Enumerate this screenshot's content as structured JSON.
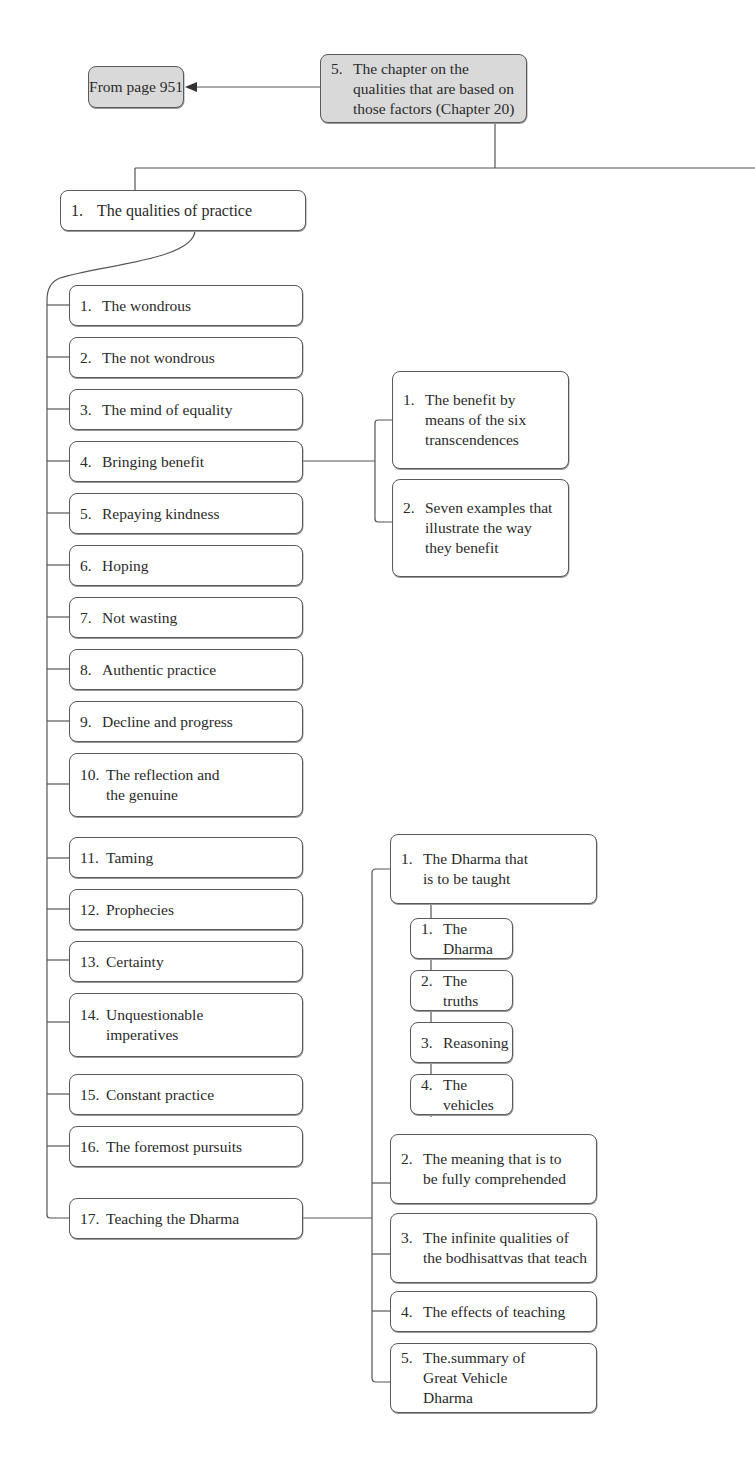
{
  "diagram": {
    "type": "outline-tree",
    "continuation": {
      "label": "From page 951"
    },
    "root": {
      "num": "5.",
      "label": "The chapter on the qualities that are based on those factors (Chapter 20)"
    },
    "level1": {
      "num": "1.",
      "label": "The qualities of practice"
    },
    "items": [
      {
        "num": "1.",
        "label": "The wondrous"
      },
      {
        "num": "2.",
        "label": "The not wondrous"
      },
      {
        "num": "3.",
        "label": "The mind of equality"
      },
      {
        "num": "4.",
        "label": "Bringing benefit"
      },
      {
        "num": "5.",
        "label": "Repaying kindness"
      },
      {
        "num": "6.",
        "label": "Hoping"
      },
      {
        "num": "7.",
        "label": "Not wasting"
      },
      {
        "num": "8.",
        "label": "Authentic practice"
      },
      {
        "num": "9.",
        "label": "Decline and progress"
      },
      {
        "num": "10.",
        "label": "The reflection and the genuine"
      },
      {
        "num": "11.",
        "label": "Taming"
      },
      {
        "num": "12.",
        "label": "Prophecies"
      },
      {
        "num": "13.",
        "label": "Certainty"
      },
      {
        "num": "14.",
        "label": "Unquestionable imperatives"
      },
      {
        "num": "15.",
        "label": "Constant practice"
      },
      {
        "num": "16.",
        "label": "The foremost pursuits"
      },
      {
        "num": "17.",
        "label": "Teaching the Dharma"
      }
    ],
    "benefit_children": [
      {
        "num": "1.",
        "label": "The benefit by means of the six transcendences"
      },
      {
        "num": "2.",
        "label": "Seven examples that illustrate the way they benefit"
      }
    ],
    "teaching_children": [
      {
        "num": "1.",
        "label": "The Dharma that is to be taught"
      },
      {
        "num": "2.",
        "label": "The meaning that is to be fully comprehended"
      },
      {
        "num": "3.",
        "label": "The infinite qualities of the bodhisattvas that teach"
      },
      {
        "num": "4.",
        "label": "The effects of teaching"
      },
      {
        "num": "5.",
        "label": "The.summary of Great Vehicle Dharma"
      }
    ],
    "dharma_children": [
      {
        "num": "1.",
        "label": "The Dharma"
      },
      {
        "num": "2.",
        "label": "The truths"
      },
      {
        "num": "3.",
        "label": "Reasoning"
      },
      {
        "num": "4.",
        "label": "The vehicles"
      }
    ],
    "colors": {
      "root_fill": "#d9d9d9",
      "box_fill": "#ffffff",
      "line": "#555555"
    }
  }
}
